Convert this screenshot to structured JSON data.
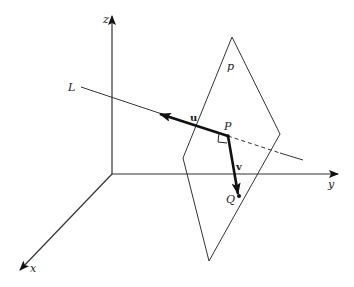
{
  "diagram": {
    "type": "3d-vector-geometry",
    "colors": {
      "line": "#333333",
      "vector": "#111111",
      "background": "#ffffff"
    },
    "axes": {
      "origin": [
        112,
        174
      ],
      "z": {
        "label": "z",
        "end": [
          112,
          15
        ]
      },
      "y": {
        "label": "y",
        "end": [
          338,
          174
        ]
      },
      "x": {
        "label": "x",
        "end": [
          20,
          270
        ]
      }
    },
    "plane": {
      "label": "p",
      "vertices": [
        [
          232,
          37
        ],
        [
          280,
          134
        ],
        [
          209,
          261
        ],
        [
          183,
          158
        ]
      ]
    },
    "line": {
      "label": "L",
      "start": [
        81,
        87
      ],
      "end": [
        303,
        160
      ],
      "dashed_segment": [
        [
          228,
          136
        ],
        [
          280,
          153
        ]
      ]
    },
    "points": {
      "P": {
        "label": "P",
        "pos": [
          228,
          136
        ]
      },
      "Q": {
        "label": "Q",
        "pos": [
          239,
          196
        ]
      }
    },
    "vectors": {
      "u": {
        "label": "u",
        "from": [
          228,
          136
        ],
        "to": [
          160,
          114
        ]
      },
      "v": {
        "label": "v",
        "from": [
          228,
          136
        ],
        "to": [
          239,
          196
        ]
      }
    },
    "right_angle_marker": true
  }
}
